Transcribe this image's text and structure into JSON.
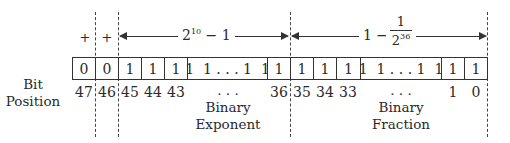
{
  "diagram": {
    "row_label": [
      "Bit",
      "Position"
    ],
    "signs": {
      "bit47": "+",
      "bit46": "+"
    },
    "exponent_range": {
      "base": "2",
      "power": "10",
      "suffix": " − 1"
    },
    "fraction_range": {
      "prefix": "1 − ",
      "numerator": "1",
      "denominator_base": "2",
      "denominator_power": "36"
    },
    "cells": [
      {
        "bit": "47",
        "value": "0"
      },
      {
        "bit": "46",
        "value": "0"
      },
      {
        "bit": "45",
        "value": "1"
      },
      {
        "bit": "44",
        "value": "1"
      },
      {
        "bit": "43",
        "value": "1"
      },
      {
        "bit": "...",
        "value": "1  1 . . . 1  1"
      },
      {
        "bit": "36",
        "value": "1"
      },
      {
        "bit": "35",
        "value": "1"
      },
      {
        "bit": "34",
        "value": "1"
      },
      {
        "bit": "33",
        "value": "1"
      },
      {
        "bit": "...",
        "value": "1  1 . . . 1  1"
      },
      {
        "bit": "1",
        "value": "1"
      },
      {
        "bit": "0",
        "value": "1"
      }
    ],
    "field_labels": {
      "exponent": [
        "Binary",
        "Exponent"
      ],
      "fraction": [
        "Binary",
        "Fraction"
      ]
    },
    "ellipsis": ". . ."
  }
}
